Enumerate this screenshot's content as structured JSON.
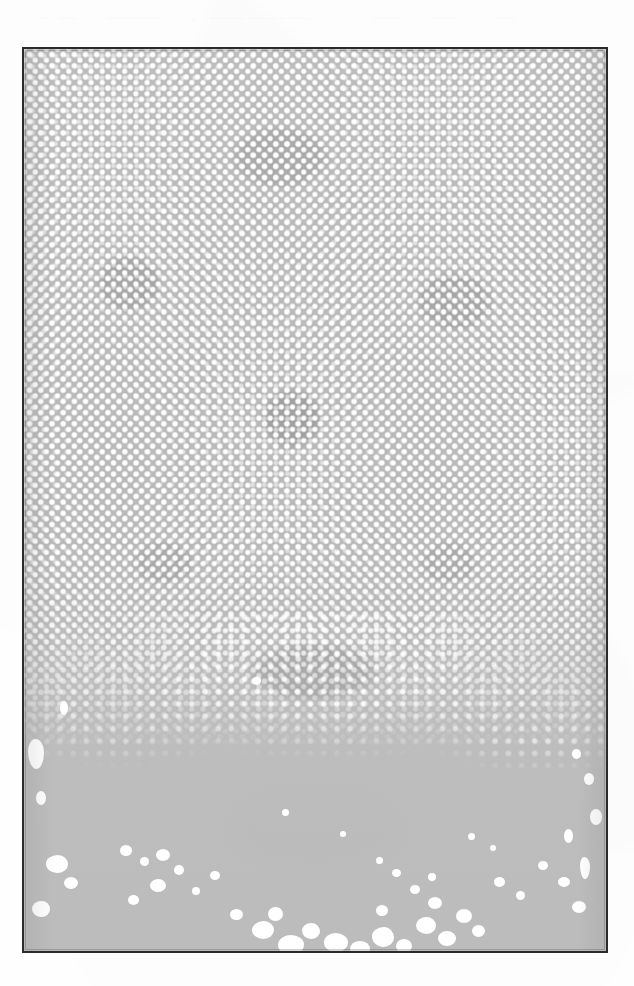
{
  "page": {
    "background_color": "#fefefe",
    "width": 634,
    "height": 986
  },
  "header_ghost": {
    "description": "barely-legible ghost text along the top margin of the scan",
    "fragments": [
      "·",
      "—",
      "——",
      "——————",
      "—",
      "———— ——— ———→",
      "———",
      "———",
      "——",
      "·",
      "·"
    ]
  },
  "right_margin_ghost": {
    "description": "faint scanner speckle marks in the right margin",
    "marks": [
      "·",
      "·",
      "·",
      "·",
      "·"
    ]
  },
  "plate": {
    "label": "halftone-photographic-plate",
    "frame_color": "#2b2b2b",
    "frame_width_px": 2,
    "base_tone": "#b9b9b9",
    "dot_color": "#ffffff",
    "shadow_tone": "#7e7e7e",
    "screen": {
      "type": "halftone",
      "dot_pitch_px": 11.2,
      "angle_deg": 45,
      "dense_region_height_px": 700,
      "fade_start_pct": 72,
      "fade_end_pct": 100
    },
    "bounds": {
      "x": 22,
      "y": 47,
      "width": 586,
      "height": 906
    },
    "tonal_blotches": [
      {
        "name": "upper-center-mass",
        "cx_pct": 44,
        "cy_pct": 12
      },
      {
        "name": "upper-left-mass",
        "cx_pct": 18,
        "cy_pct": 26
      },
      {
        "name": "upper-right-mass",
        "cx_pct": 74,
        "cy_pct": 28
      },
      {
        "name": "center-core",
        "cx_pct": 46,
        "cy_pct": 41
      },
      {
        "name": "mid-left-mass",
        "cx_pct": 24,
        "cy_pct": 57
      },
      {
        "name": "mid-right-mass",
        "cx_pct": 73,
        "cy_pct": 57
      },
      {
        "name": "lower-band",
        "cx_pct": 50,
        "cy_pct": 69
      },
      {
        "name": "base-haze",
        "cx_pct": 50,
        "cy_pct": 86
      }
    ],
    "blobs": [
      {
        "left": 4,
        "top": 690,
        "w": 16,
        "h": 30,
        "r": "48% 52% 46% 54% / 40% 44% 56% 60%"
      },
      {
        "left": 12,
        "top": 742,
        "w": 10,
        "h": 14,
        "r": "50%"
      },
      {
        "left": 22,
        "top": 806,
        "w": 22,
        "h": 18,
        "r": "54% 46% 50% 50% / 48% 52% 48% 52%"
      },
      {
        "left": 40,
        "top": 828,
        "w": 14,
        "h": 12,
        "r": "50%"
      },
      {
        "left": 8,
        "top": 852,
        "w": 18,
        "h": 16,
        "r": "52% 48% 46% 54% / 50% 50% 50% 50%"
      },
      {
        "left": 96,
        "top": 796,
        "w": 12,
        "h": 11,
        "r": "50%"
      },
      {
        "left": 116,
        "top": 808,
        "w": 9,
        "h": 9,
        "r": "50%"
      },
      {
        "left": 132,
        "top": 800,
        "w": 14,
        "h": 12,
        "r": "50%"
      },
      {
        "left": 150,
        "top": 816,
        "w": 10,
        "h": 10,
        "r": "50%"
      },
      {
        "left": 126,
        "top": 830,
        "w": 16,
        "h": 13,
        "r": "52% 48% 50% 50% / 50% 50% 50% 50%"
      },
      {
        "left": 104,
        "top": 846,
        "w": 11,
        "h": 10,
        "r": "50%"
      },
      {
        "left": 168,
        "top": 838,
        "w": 8,
        "h": 8,
        "r": "50%"
      },
      {
        "left": 186,
        "top": 822,
        "w": 10,
        "h": 9,
        "r": "50%"
      },
      {
        "left": 206,
        "top": 860,
        "w": 13,
        "h": 11,
        "r": "50%"
      },
      {
        "left": 228,
        "top": 872,
        "w": 22,
        "h": 18,
        "r": "54% 46% 48% 52% / 50% 50% 50% 50%"
      },
      {
        "left": 254,
        "top": 886,
        "w": 26,
        "h": 20,
        "r": "50% 50% 46% 54% / 52% 48% 52% 48%"
      },
      {
        "left": 244,
        "top": 858,
        "w": 15,
        "h": 14,
        "r": "50%"
      },
      {
        "left": 278,
        "top": 874,
        "w": 18,
        "h": 16,
        "r": "52% 48% 50% 50% / 48% 52% 48% 52%"
      },
      {
        "left": 300,
        "top": 884,
        "w": 24,
        "h": 19,
        "r": "48% 52% 52% 48% / 50% 50% 50% 50%"
      },
      {
        "left": 326,
        "top": 892,
        "w": 20,
        "h": 16,
        "r": "50%"
      },
      {
        "left": 348,
        "top": 878,
        "w": 22,
        "h": 20,
        "r": "54% 46% 48% 52% / 46% 54% 46% 54%"
      },
      {
        "left": 372,
        "top": 890,
        "w": 16,
        "h": 14,
        "r": "50%"
      },
      {
        "left": 352,
        "top": 856,
        "w": 12,
        "h": 11,
        "r": "50%"
      },
      {
        "left": 392,
        "top": 868,
        "w": 20,
        "h": 17,
        "r": "52% 48% 46% 54% / 50% 50% 50% 50%"
      },
      {
        "left": 414,
        "top": 882,
        "w": 18,
        "h": 15,
        "r": "50%"
      },
      {
        "left": 404,
        "top": 848,
        "w": 14,
        "h": 12,
        "r": "50%"
      },
      {
        "left": 432,
        "top": 860,
        "w": 16,
        "h": 14,
        "r": "50%"
      },
      {
        "left": 448,
        "top": 876,
        "w": 13,
        "h": 12,
        "r": "50%"
      },
      {
        "left": 386,
        "top": 836,
        "w": 10,
        "h": 9,
        "r": "50%"
      },
      {
        "left": 404,
        "top": 824,
        "w": 8,
        "h": 8,
        "r": "50%"
      },
      {
        "left": 368,
        "top": 820,
        "w": 9,
        "h": 8,
        "r": "50%"
      },
      {
        "left": 352,
        "top": 808,
        "w": 7,
        "h": 7,
        "r": "50%"
      },
      {
        "left": 470,
        "top": 828,
        "w": 11,
        "h": 10,
        "r": "50%"
      },
      {
        "left": 492,
        "top": 842,
        "w": 9,
        "h": 9,
        "r": "50%"
      },
      {
        "left": 514,
        "top": 812,
        "w": 10,
        "h": 9,
        "r": "50%"
      },
      {
        "left": 534,
        "top": 828,
        "w": 12,
        "h": 10,
        "r": "50%"
      },
      {
        "left": 548,
        "top": 852,
        "w": 14,
        "h": 12,
        "r": "50%"
      },
      {
        "left": 556,
        "top": 808,
        "w": 10,
        "h": 22,
        "r": "44% 56% 50% 50% / 38% 42% 58% 62%"
      },
      {
        "left": 540,
        "top": 780,
        "w": 9,
        "h": 14,
        "r": "50%"
      },
      {
        "left": 566,
        "top": 760,
        "w": 12,
        "h": 16,
        "r": "50%"
      },
      {
        "left": 560,
        "top": 724,
        "w": 10,
        "h": 12,
        "r": "50%"
      },
      {
        "left": 548,
        "top": 700,
        "w": 9,
        "h": 10,
        "r": "50%"
      },
      {
        "left": 36,
        "top": 652,
        "w": 8,
        "h": 14,
        "r": "50%"
      },
      {
        "left": 228,
        "top": 628,
        "w": 9,
        "h": 8,
        "r": "50%"
      },
      {
        "left": 258,
        "top": 760,
        "w": 7,
        "h": 7,
        "r": "50%"
      },
      {
        "left": 316,
        "top": 782,
        "w": 6,
        "h": 6,
        "r": "50%"
      },
      {
        "left": 444,
        "top": 784,
        "w": 7,
        "h": 7,
        "r": "50%"
      },
      {
        "left": 466,
        "top": 796,
        "w": 6,
        "h": 6,
        "r": "50%"
      }
    ]
  }
}
